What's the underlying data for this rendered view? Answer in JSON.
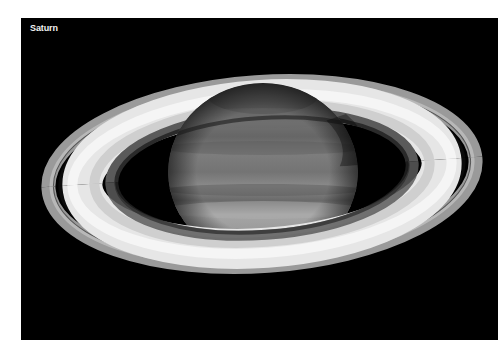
{
  "image": {
    "caption": "Saturn",
    "subject": "planet-with-rings",
    "background_color": "#000000",
    "page_background": "#ffffff"
  }
}
